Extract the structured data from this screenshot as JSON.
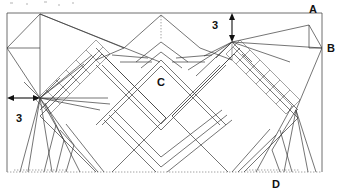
{
  "figure": {
    "type": "technical-line-drawing",
    "labels": [
      {
        "id": "label-a",
        "text": "A",
        "x": 313,
        "y": 11
      },
      {
        "id": "label-b",
        "text": "B",
        "x": 328,
        "y": 48
      },
      {
        "id": "label-c",
        "text": "C",
        "x": 161,
        "y": 82
      },
      {
        "id": "label-d",
        "text": "D",
        "x": 275,
        "y": 186
      }
    ],
    "dimensions": [
      {
        "id": "dim-top-right",
        "text": "3",
        "orientation": "vertical",
        "x": 218,
        "y": 25
      },
      {
        "id": "dim-left",
        "text": "3",
        "orientation": "horizontal",
        "x": 15,
        "y": 124
      }
    ],
    "frame": {
      "left": 7,
      "top": 13,
      "right": 322,
      "bottom": 172,
      "bottom_style": "dotted"
    },
    "points": {
      "A": {
        "x": 309,
        "y": 25
      },
      "B": {
        "x": 322,
        "y": 48
      },
      "C": {
        "x": 161,
        "y": 88
      },
      "D": {
        "x": 278,
        "y": 172
      }
    },
    "colors": {
      "line": "#3a3a3a",
      "frame": "#4a4a4a",
      "dimension": "#111111",
      "label": "#111111",
      "background": "#ffffff"
    }
  }
}
